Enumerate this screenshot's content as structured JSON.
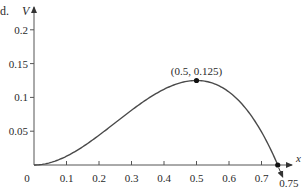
{
  "corner_label": "d.",
  "chart_data": {
    "type": "line",
    "title": "",
    "xlabel": "x",
    "ylabel": "V",
    "xlim": [
      0,
      0.8
    ],
    "ylim": [
      0,
      0.22
    ],
    "grid": false,
    "legend": null,
    "x_ticks": [
      "0.1",
      "0.2",
      "0.3",
      "0.4",
      "0.5",
      "0.6",
      "0.7"
    ],
    "y_ticks": [
      "0.05",
      "0.1",
      "0.15",
      "0.2"
    ],
    "origin_label": "0",
    "function": "V = x^2 (3 - 4x) / 2",
    "series": [
      {
        "name": "V(x)",
        "x": [
          0,
          0.05,
          0.1,
          0.15,
          0.2,
          0.25,
          0.3,
          0.35,
          0.4,
          0.45,
          0.5,
          0.55,
          0.6,
          0.65,
          0.7,
          0.75
        ],
        "values": [
          0,
          0.0035,
          0.013,
          0.027,
          0.044,
          0.0625,
          0.081,
          0.098,
          0.112,
          0.1215,
          0.125,
          0.121,
          0.108,
          0.0845,
          0.049,
          0
        ]
      }
    ],
    "annotations": [
      {
        "x": 0.5,
        "y": 0.125,
        "text": "(0.5, 0.125)",
        "marker": "dot"
      },
      {
        "x": 0.75,
        "y": 0,
        "text": "0.75",
        "marker": "dot",
        "arrow": true
      }
    ],
    "colors": {
      "curve": "#4a4a4a",
      "axis": "#555555",
      "text": "#2a2a2a"
    }
  }
}
